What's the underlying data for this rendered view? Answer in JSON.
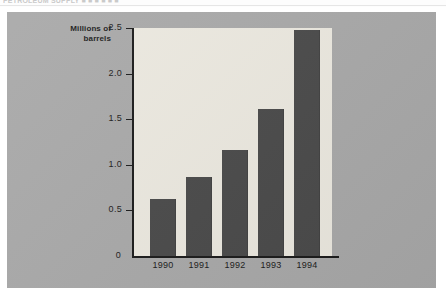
{
  "page": {
    "top_fragment": "PETROLEUM  SUPPLY  ■ ■   ■ ■ ■ ■",
    "background_color": "#ffffff"
  },
  "figure": {
    "panel_color": "#a9a9a9",
    "plot_background_color": "#ece9e0",
    "axis_color": "#1b1b1b",
    "bar_color": "#4a4a4a"
  },
  "chart_data": {
    "type": "bar",
    "title": "",
    "xlabel": "",
    "ylabel": "Millions of barrels",
    "ylabel_lines": [
      "Millions of",
      "barrels"
    ],
    "categories": [
      "1990",
      "1991",
      "1992",
      "1993",
      "1994"
    ],
    "values": [
      0.62,
      0.87,
      1.16,
      1.61,
      2.48
    ],
    "ylim": [
      0,
      2.5
    ],
    "yticks": [
      0,
      0.5,
      1.0,
      1.5,
      2.0,
      2.5
    ],
    "ytick_labels": [
      "0",
      "0.5",
      "1.0",
      "1.5",
      "2.0",
      "2.5"
    ],
    "grid": false,
    "legend": null
  }
}
